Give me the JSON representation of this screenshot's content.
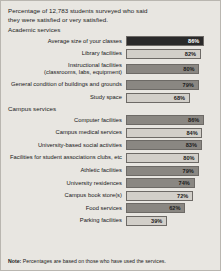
{
  "title": {
    "line1": "Percentage of 12,783 students surveyed who said",
    "line2": "they were satisfied or very satisfied."
  },
  "sections": [
    {
      "heading": "Academic services",
      "rows": [
        {
          "label": "Average size of your classes",
          "label2": "",
          "value": 86,
          "display": "86%",
          "shade": "dark",
          "value_on_color": true
        },
        {
          "label": "Library facilities",
          "label2": "",
          "value": 82,
          "display": "82%",
          "shade": "light",
          "value_on_color": false
        },
        {
          "label": "Instructional facilities",
          "label2": "(classrooms, labs, equipment)",
          "value": 80,
          "display": "80%",
          "shade": "mid",
          "value_on_color": false
        },
        {
          "label": "General condition of buildings and grounds",
          "label2": "",
          "value": 79,
          "display": "79%",
          "shade": "mid",
          "value_on_color": false
        },
        {
          "label": "Study space",
          "label2": "",
          "value": 68,
          "display": "68%",
          "shade": "light",
          "value_on_color": false
        }
      ]
    },
    {
      "heading": "Campus services",
      "rows": [
        {
          "label": "Computer facilities",
          "label2": "",
          "value": 86,
          "display": "86%",
          "shade": "mid",
          "value_on_color": false
        },
        {
          "label": "Campus medical services",
          "label2": "",
          "value": 84,
          "display": "84%",
          "shade": "light",
          "value_on_color": false
        },
        {
          "label": "University-based social activities",
          "label2": "",
          "value": 83,
          "display": "83%",
          "shade": "mid",
          "value_on_color": false
        },
        {
          "label": "Facilities for student associations clubs, etc",
          "label2": "",
          "value": 80,
          "display": "80%",
          "shade": "light",
          "value_on_color": false
        },
        {
          "label": "Athletic facilities",
          "label2": "",
          "value": 79,
          "display": "79%",
          "shade": "mid",
          "value_on_color": false
        },
        {
          "label": "University residences",
          "label2": "",
          "value": 74,
          "display": "74%",
          "shade": "mid",
          "value_on_color": false
        },
        {
          "label": "Campus book store(s)",
          "label2": "",
          "value": 72,
          "display": "72%",
          "shade": "light",
          "value_on_color": false
        },
        {
          "label": "Food services",
          "label2": "",
          "value": 62,
          "display": "62%",
          "shade": "mid",
          "value_on_color": false
        },
        {
          "label": "Parking facilities",
          "label2": "",
          "value": 39,
          "display": "39%",
          "shade": "light",
          "value_on_color": false
        }
      ]
    }
  ],
  "note": {
    "label": "Note:",
    "text": " Percentages are based on those who have used the services."
  },
  "colors": {
    "card_background": "#e8e6e1",
    "card_border": "#b9b6b0",
    "bar_border": "#6d6a66",
    "bar_track": "#d2cfc9",
    "fill_dark": "#2a2a2a",
    "fill_mid": "#8a8782",
    "fill_light": "#c5c2bc",
    "text": "#1a1a1a"
  },
  "chart_data": {
    "type": "bar",
    "title": "Percentage of 12,783 students surveyed who said they were satisfied or very satisfied.",
    "xlabel": "",
    "ylabel": "",
    "xlim": [
      0,
      100
    ],
    "grid": false,
    "legend": "none",
    "orientation": "horizontal",
    "units": "percent",
    "groups": [
      "Academic services",
      "Campus services"
    ],
    "categories": [
      "Average size of your classes",
      "Library facilities",
      "Instructional facilities (classrooms, labs, equipment)",
      "General condition of buildings and grounds",
      "Study space",
      "Computer facilities",
      "Campus medical services",
      "University-based social activities",
      "Facilities for student associations clubs, etc",
      "Athletic facilities",
      "University residences",
      "Campus book store(s)",
      "Food services",
      "Parking facilities"
    ],
    "values": [
      86,
      82,
      80,
      79,
      68,
      86,
      84,
      83,
      80,
      79,
      74,
      72,
      62,
      39
    ],
    "annotation": "Note: Percentages are based on those who have used the services."
  }
}
